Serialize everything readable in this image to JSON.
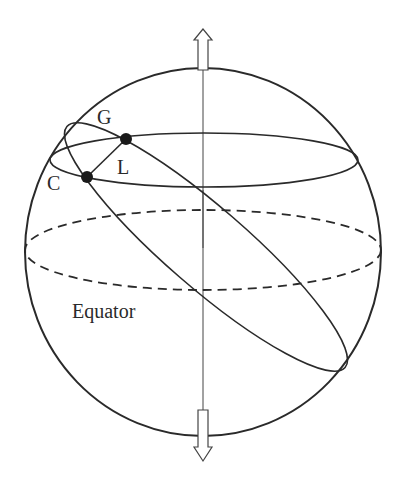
{
  "diagram": {
    "type": "celestial-sphere",
    "labels": {
      "G": "G",
      "L": "L",
      "C": "C",
      "equator": "Equator"
    },
    "points": [
      {
        "name": "G",
        "x": 126,
        "y": 139
      },
      {
        "name": "C",
        "x": 87,
        "y": 177
      }
    ],
    "colors": {
      "stroke": "#2a2a2a",
      "background": "#ffffff"
    }
  }
}
